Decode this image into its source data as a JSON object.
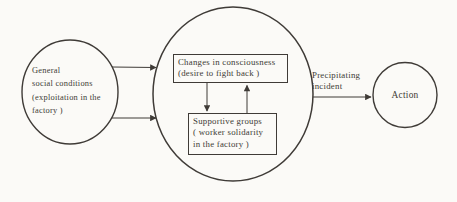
{
  "colors": {
    "ink": "#3f3b37",
    "paper": "#fbfaf7"
  },
  "diagram": {
    "left_circle": {
      "lines": [
        "General",
        "social conditions",
        "(exploitation in the",
        "factory )"
      ]
    },
    "consciousness_box": {
      "lines": [
        "Changes in consciousness",
        "(desire to fight back )"
      ]
    },
    "supportive_box": {
      "lines": [
        "Supportive groups",
        "( worker solidarity",
        "in the factory )"
      ]
    },
    "precipitating_label": {
      "lines": [
        "Precipitating",
        "incident"
      ]
    },
    "action_circle": {
      "label": "Action"
    }
  }
}
